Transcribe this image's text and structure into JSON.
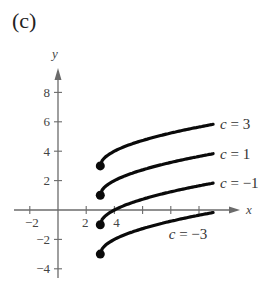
{
  "panel_label": "(c)",
  "chart_data": {
    "type": "line",
    "title": "(c)",
    "xlabel": "x",
    "ylabel": "y",
    "function": "y = sqrt(x - 3) + c",
    "xlim": [
      -3,
      12
    ],
    "ylim": [
      -5,
      9.5
    ],
    "x_ticks": [
      -2,
      2,
      4,
      6,
      8,
      10
    ],
    "x_tick_labels": [
      "-2",
      "2",
      "4"
    ],
    "y_ticks": [
      -4,
      -2,
      2,
      4,
      6,
      8
    ],
    "y_tick_labels": [
      "-4",
      "-2",
      "2",
      "4",
      "6",
      "8"
    ],
    "grid": false,
    "series": [
      {
        "name": "c = 3",
        "c": 3,
        "start_point": [
          3,
          3
        ],
        "x": [
          3,
          4,
          5,
          7,
          9,
          11
        ],
        "values": [
          3,
          4,
          4.41,
          5,
          5.45,
          5.83
        ]
      },
      {
        "name": "c = 1",
        "c": 1,
        "start_point": [
          3,
          1
        ],
        "x": [
          3,
          4,
          5,
          7,
          9,
          11
        ],
        "values": [
          1,
          2,
          2.41,
          3,
          3.45,
          3.83
        ]
      },
      {
        "name": "c = -1",
        "c": -1,
        "start_point": [
          3,
          -1
        ],
        "x": [
          3,
          4,
          5,
          7,
          9,
          11
        ],
        "values": [
          -1,
          0,
          0.41,
          1,
          1.45,
          1.83
        ]
      },
      {
        "name": "c = -3",
        "c": -3,
        "start_point": [
          3,
          -3
        ],
        "x": [
          3,
          4,
          5,
          7,
          9,
          11
        ],
        "values": [
          -3,
          -2,
          -1.59,
          -1,
          -0.55,
          -0.17
        ]
      }
    ],
    "colors": {
      "axis": "#6b6b6b",
      "curve": "#0a0a0a",
      "text": "#444444"
    }
  }
}
